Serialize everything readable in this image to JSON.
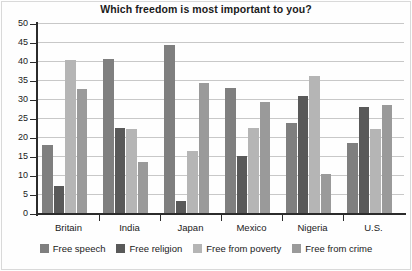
{
  "chart_data": {
    "type": "bar",
    "title": "Which freedom is most important to you?",
    "xlabel": "",
    "ylabel": "",
    "ylim": [
      0,
      50
    ],
    "yticks": [
      0,
      5,
      10,
      15,
      20,
      25,
      30,
      35,
      40,
      45,
      50
    ],
    "grid": true,
    "legend_position": "bottom",
    "categories": [
      "Britain",
      "India",
      "Japan",
      "Mexico",
      "Nigeria",
      "U.S."
    ],
    "series": [
      {
        "name": "Free speech",
        "color": "#7f7f7f",
        "values": [
          18.2,
          40.8,
          44.6,
          33.2,
          23.9,
          18.8
        ]
      },
      {
        "name": "Free religion",
        "color": "#595959",
        "values": [
          7.5,
          22.6,
          3.5,
          15.2,
          31.0,
          28.2
        ]
      },
      {
        "name": "Free from poverty",
        "color": "#b5b5b5",
        "values": [
          40.4,
          22.5,
          16.6,
          22.6,
          36.4,
          22.3
        ]
      },
      {
        "name": "Free from crime",
        "color": "#9a9a9a",
        "values": [
          32.9,
          13.8,
          34.4,
          29.5,
          10.5,
          28.7
        ]
      }
    ]
  },
  "axis": {
    "y_tick_labels": [
      "50",
      "45",
      "40",
      "35",
      "30",
      "25",
      "20",
      "15",
      "10",
      "5",
      "0"
    ]
  }
}
